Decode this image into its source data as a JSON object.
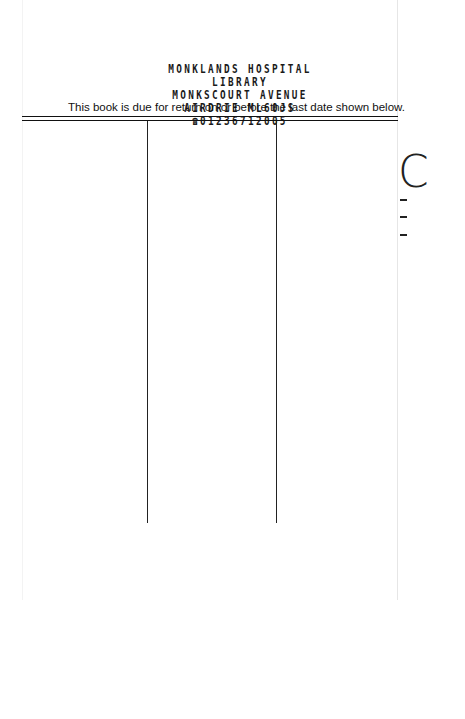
{
  "slip": {
    "notice": "This book is due for return on or before the last date shown below.",
    "stamp": {
      "line1": "MONKLANDS HOSPITAL",
      "line2": "LIBRARY",
      "line3": "MONKSCOURT AVENUE",
      "line4": "AIRDRIE  ML60JS",
      "phone_icon": "☎",
      "phone": "01236712005"
    },
    "right_edge_mark": "C"
  }
}
